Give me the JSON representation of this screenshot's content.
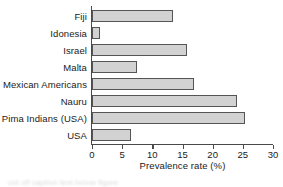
{
  "chart_data": {
    "type": "bar",
    "orientation": "horizontal",
    "title": "",
    "xlabel": "Prevalence rate (%)",
    "ylabel": "",
    "xlim": [
      0,
      30
    ],
    "xticks": [
      0,
      5,
      10,
      15,
      20,
      25,
      30
    ],
    "grid": false,
    "legend": null,
    "categories": [
      "Fiji",
      "Idonesia",
      "Israel",
      "Malta",
      "Mexican Americans",
      "Nauru",
      "Pima Indians (USA)",
      "USA"
    ],
    "values": [
      13.4,
      1.4,
      15.7,
      7.5,
      16.9,
      24.0,
      25.4,
      6.4
    ],
    "series": [
      {
        "name": "Prevalence rate (%)",
        "values": [
          13.4,
          1.4,
          15.7,
          7.5,
          16.9,
          24.0,
          25.4,
          6.4
        ]
      }
    ],
    "bar_fill_color": "#d2d2d2",
    "bar_edge_color": "#555555",
    "axis_color": "#4a4a4a"
  },
  "caption": {
    "ghost_text": "cut off caption text below figure"
  }
}
